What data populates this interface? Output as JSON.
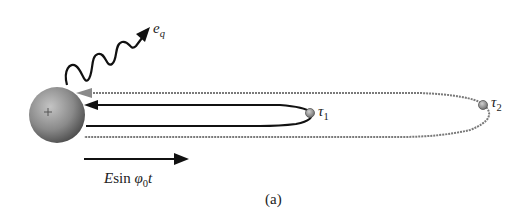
{
  "figure": {
    "caption": "(a)",
    "emission": {
      "label_symbol": "e",
      "label_subscript": "q"
    },
    "field": {
      "label_E": "E",
      "label_sin": "sin",
      "label_phi": "φ",
      "label_phi_subscript": "0",
      "label_t": "t"
    },
    "nucleus": {
      "charge_symbol": "+"
    },
    "trajectories": [
      {
        "name": "short",
        "label_symbol": "τ",
        "label_subscript": "1",
        "style": "black solid"
      },
      {
        "name": "long",
        "label_symbol": "τ",
        "label_subscript": "2",
        "style": "gray dashed"
      }
    ]
  },
  "colors": {
    "inner_orbit": "#111111",
    "outer_orbit": "#7a7a7a",
    "sphere_light": "#b5b5b5",
    "sphere_dark": "#4a4a4a",
    "electron": "#9a9a9a"
  }
}
